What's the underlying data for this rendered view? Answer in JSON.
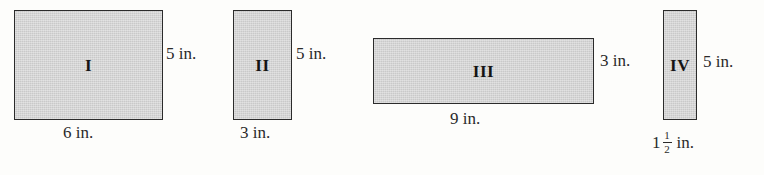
{
  "figure": {
    "background_color": "#fdfdfb",
    "fill_color": "#c9c9c9",
    "stroke_color": "#2b2b2b"
  },
  "shapes": [
    {
      "name": "rectangle-1",
      "label": "I",
      "height_label": "5 in.",
      "width_label": "6 in."
    },
    {
      "name": "rectangle-2",
      "label": "II",
      "height_label": "5 in.",
      "width_label": "3 in."
    },
    {
      "name": "rectangle-3",
      "label": "III",
      "height_label": "3 in.",
      "width_label": "9 in."
    },
    {
      "name": "rectangle-4",
      "label": "IV",
      "height_label": "5 in.",
      "width_label": {
        "whole": "1",
        "numerator": "1",
        "denominator": "2",
        "unit": "in."
      }
    }
  ]
}
